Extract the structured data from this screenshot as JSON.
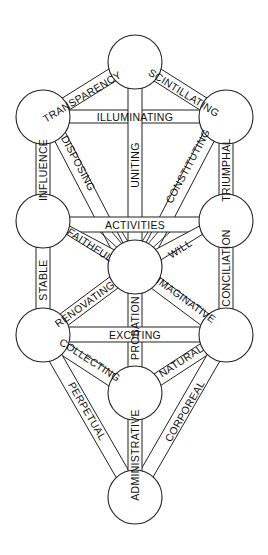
{
  "diagram": {
    "type": "tree-of-life",
    "colors": {
      "line": "#222222",
      "fill": "#ffffff",
      "text": "#111111"
    },
    "nodes": [
      {
        "id": "top",
        "x": 135,
        "y": 62
      },
      {
        "id": "upper-left",
        "x": 43,
        "y": 117
      },
      {
        "id": "upper-right",
        "x": 226,
        "y": 117
      },
      {
        "id": "middle-left",
        "x": 43,
        "y": 221
      },
      {
        "id": "middle-right",
        "x": 226,
        "y": 221
      },
      {
        "id": "center",
        "x": 135,
        "y": 267
      },
      {
        "id": "lower-left",
        "x": 43,
        "y": 335
      },
      {
        "id": "lower-right",
        "x": 226,
        "y": 335
      },
      {
        "id": "lower-center",
        "x": 135,
        "y": 393
      },
      {
        "id": "bottom",
        "x": 135,
        "y": 497
      }
    ],
    "paths": {
      "transparency": "TRANSPARENCY",
      "scintillating": "SCINTILLATING",
      "illuminating": "ILLUMINATING",
      "influence": "INFLUENCE",
      "disposing": "DISPOSING",
      "uniting": "UNITING",
      "constituting": "CONSTITUTING",
      "triumphal": "TRIUMPHAL",
      "activities": "ACTIVITIES",
      "faithful": "FAITHFUL",
      "will": "WILL",
      "stable": "STABLE",
      "conciliation": "CONCILIATION",
      "renovating": "RENOVATING",
      "probation": "PROBATION",
      "imaginative": "IMAGINATIVE",
      "exciting": "EXCITING",
      "collecting": "COLLECTING",
      "natural": "NATURAL",
      "perpetual": "PERPETUAL",
      "corporeal": "CORPOREAL",
      "administrative": "ADMINISTRATIVE"
    }
  }
}
